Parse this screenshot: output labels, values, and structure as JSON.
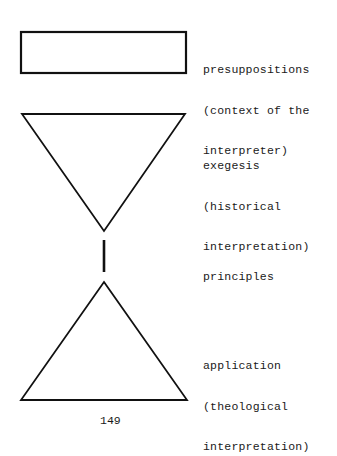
{
  "diagram": {
    "shapes": [
      {
        "id": "presuppositions",
        "type": "rectangle"
      },
      {
        "id": "exegesis",
        "type": "inverted-triangle"
      },
      {
        "id": "principles",
        "type": "vertical-line"
      },
      {
        "id": "application",
        "type": "triangle"
      }
    ],
    "labels": {
      "presuppositions": [
        "presuppositions",
        "(context of the",
        "interpreter)"
      ],
      "exegesis": [
        "exegesis",
        "(historical",
        "interpretation)"
      ],
      "principles": [
        "principles"
      ],
      "application": [
        "application",
        "(theological",
        "interpretation)"
      ]
    },
    "stroke_color": "#111111"
  },
  "page_number": "149"
}
